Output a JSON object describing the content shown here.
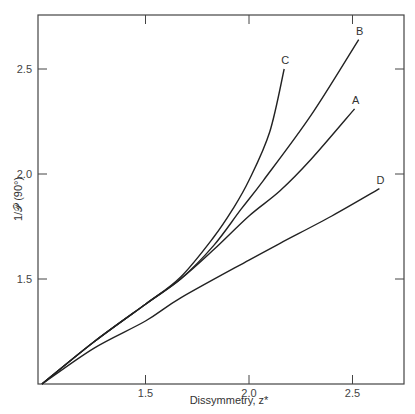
{
  "chart_data": {
    "type": "line",
    "title": "",
    "xlabel": "Dissymmetry, z*",
    "ylabel": "1/𝒫 (90°)",
    "xlim": [
      1.0,
      2.75
    ],
    "ylim": [
      1.0,
      2.76
    ],
    "x_ticks": [
      {
        "value": 1.5,
        "label": "1.5"
      },
      {
        "value": 2.0,
        "label": "2.0"
      },
      {
        "value": 2.5,
        "label": "2.5"
      }
    ],
    "y_ticks": [
      {
        "value": 1.5,
        "label": "1.5"
      },
      {
        "value": 2.0,
        "label": "2.0"
      },
      {
        "value": 2.5,
        "label": "2.5"
      }
    ],
    "grid": false,
    "legend": "inline labels at curve ends",
    "series": [
      {
        "name": "A",
        "x": [
          1.0,
          1.25,
          1.5,
          1.67,
          1.83,
          2.0,
          2.15,
          2.3,
          2.51
        ],
        "y": [
          1.0,
          1.2,
          1.38,
          1.5,
          1.64,
          1.8,
          1.92,
          2.07,
          2.31
        ]
      },
      {
        "name": "B",
        "x": [
          1.0,
          1.25,
          1.5,
          1.67,
          1.83,
          1.96,
          2.07,
          2.3,
          2.53
        ],
        "y": [
          1.0,
          1.2,
          1.38,
          1.5,
          1.66,
          1.83,
          1.97,
          2.28,
          2.64
        ]
      },
      {
        "name": "C",
        "x": [
          1.0,
          1.25,
          1.5,
          1.67,
          1.83,
          1.92,
          2.0,
          2.1,
          2.17
        ],
        "y": [
          1.0,
          1.2,
          1.38,
          1.51,
          1.7,
          1.83,
          1.97,
          2.2,
          2.5
        ]
      },
      {
        "name": "D",
        "x": [
          1.0,
          1.25,
          1.5,
          1.67,
          2.0,
          2.15,
          2.4,
          2.63
        ],
        "y": [
          1.0,
          1.17,
          1.3,
          1.41,
          1.59,
          1.67,
          1.8,
          1.93
        ]
      }
    ]
  }
}
